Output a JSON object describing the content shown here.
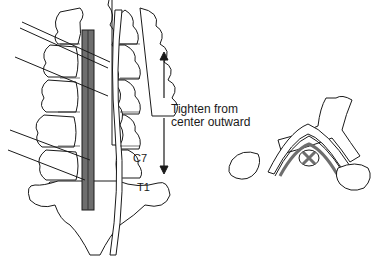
{
  "figure": {
    "labels": {
      "instruction_line1": "Tighten from",
      "instruction_line2": "center outward",
      "vertebra_c7": "C7",
      "vertebra_t1": "T1"
    },
    "colors": {
      "line": "#1a1a1a",
      "plate_fill": "#6e6e6e",
      "bone_fill": "#ffffff",
      "cord_fill": "#8a8a8a"
    },
    "panels": [
      {
        "name": "posterior-view",
        "description": "Posterior view of cervical spine with plate and wires"
      },
      {
        "name": "axial-section",
        "description": "Axial cross-section of vertebra with spinal cord"
      }
    ]
  }
}
